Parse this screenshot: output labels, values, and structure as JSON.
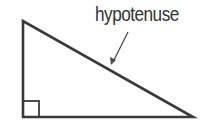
{
  "diagram": {
    "label": "hypotenuse",
    "colors": {
      "stroke": "#3a3a3a",
      "label": "#333333",
      "arrow": "#4a4a4a",
      "background": "#ffffff"
    },
    "shape": {
      "type": "right-triangle",
      "vertices": [
        [
          23,
          21
        ],
        [
          23,
          117
        ],
        [
          193,
          117
        ]
      ],
      "right_angle_marker": {
        "x": 23,
        "y": 101,
        "size": 16
      }
    },
    "arrow": {
      "from": [
        128,
        32
      ],
      "to": [
        112,
        64
      ]
    }
  }
}
